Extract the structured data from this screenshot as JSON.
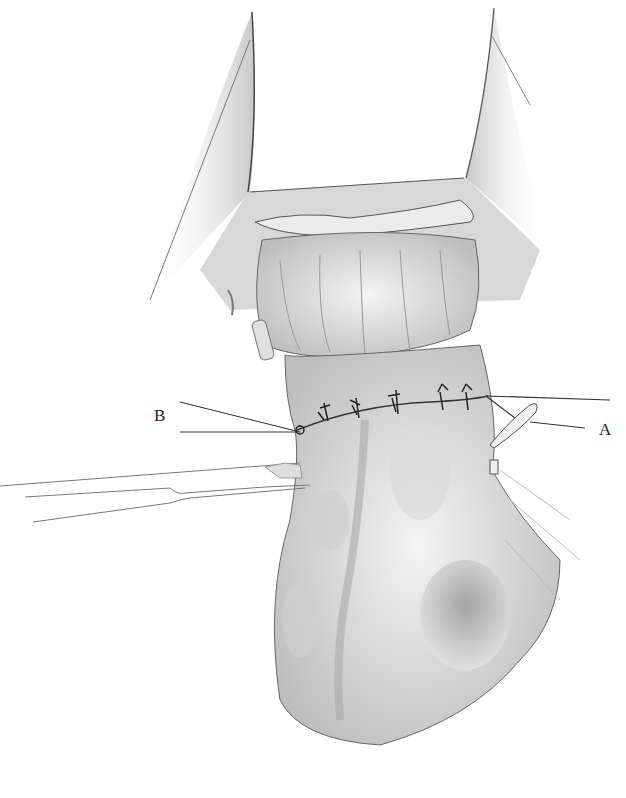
{
  "figure": {
    "labels": {
      "left": "B",
      "right": "A"
    },
    "colors": {
      "background": "#ffffff",
      "line": "#333333",
      "tissue_shade": "#cfcfcf",
      "tissue_light": "#ececec"
    },
    "sutures": 6
  }
}
